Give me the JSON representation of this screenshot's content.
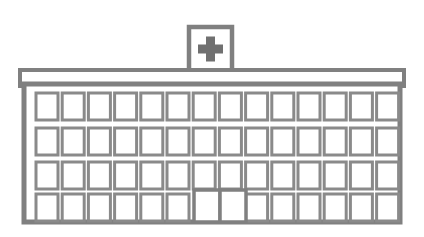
{
  "meta": {
    "title": "Hospital Building",
    "description": "Line-art illustration of a multi-storey hospital building with a medical cross sign on the roof",
    "width": 424,
    "height": 237
  },
  "colors": {
    "background": "#ffffff",
    "outline": "#808080",
    "window_outline": "#8a8a8a",
    "cross_fill": "#707070",
    "fill": "#ffffff"
  },
  "sign": {
    "name": "rooftop-medical-sign",
    "symbol": "medical-cross",
    "x": 189,
    "y": 27,
    "width": 43,
    "height": 44,
    "cross": {
      "arm_thickness": 9,
      "size": 25,
      "center_x": 210.5,
      "center_y": 49
    }
  },
  "roof": {
    "name": "roof-cornice-band",
    "x": 20,
    "y": 70,
    "width": 384,
    "height": 16
  },
  "facade": {
    "name": "building-facade",
    "x": 24,
    "y": 84,
    "width": 376,
    "height": 138,
    "wall_thickness": 10
  },
  "grid": {
    "columns": 14,
    "rows": 4,
    "window_width": 22,
    "window_height": 27,
    "first_window_x": 36,
    "column_pitch": 26.2,
    "row_y": [
      93,
      128,
      162,
      194
    ],
    "row_labels": [
      "floor-4",
      "floor-3",
      "floor-2",
      "floor-1"
    ]
  },
  "door": {
    "name": "main-entrance",
    "label": "Main entrance double door",
    "x": 194,
    "y": 190,
    "width": 52,
    "height": 32,
    "panels": 2,
    "occupies_columns": [
      7,
      8
    ]
  },
  "windows_per_row": [
    14,
    14,
    14,
    12
  ],
  "total_windows": 54
}
